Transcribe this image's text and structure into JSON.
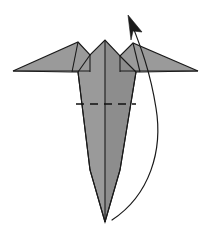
{
  "diagram": {
    "title": "Origami fold step diagram",
    "canvas": {
      "width": 211,
      "height": 243,
      "background": "#ffffff"
    },
    "colors": {
      "paper_front": "#9a9a9a",
      "paper_shade": "#8d8d8d",
      "outline": "#1a1a1a",
      "fold_line": "#111111",
      "background": "#ffffff"
    },
    "shapes": {
      "left_wing": {
        "name": "left-wing",
        "points": "13,71 78,42 90,55 90,71"
      },
      "right_wing": {
        "name": "right-wing",
        "points": "198,71 133,43 120,56 120,71"
      },
      "left_peak_panel": {
        "name": "left-peak-panel",
        "points": "78,42 90,55 90,72 72,72"
      },
      "right_peak_panel": {
        "name": "right-peak-panel",
        "points": "133,43 120,56 120,72 140,72"
      },
      "center_body": {
        "name": "center-body",
        "points": "105,40 90,55 78,72 90,170 105,222 120,170 136,72 120,56"
      },
      "body_left_half": {
        "name": "body-left-half",
        "points": "105,40 90,55 78,72 90,170 105,222"
      },
      "body_right_half": {
        "name": "body-right-half",
        "points": "105,40 120,56 136,72 120,170 105,222"
      },
      "silhouette_outline": {
        "name": "figure-outline",
        "points": "13,71 78,42 90,55 105,40 120,56 133,43 198,71 140,72 136,72 120,170 105,222 90,170 78,72 72,72"
      }
    },
    "creases": {
      "center_spine": {
        "name": "center-spine-crease",
        "path": "M 105 40 L 105 222"
      },
      "left_inner": {
        "name": "left-inner-crease",
        "path": "M 90 55 L 78 72"
      },
      "right_inner": {
        "name": "right-inner-crease",
        "path": "M 120 56 L 136 72"
      },
      "left_wing_root": {
        "name": "left-wing-root-crease",
        "path": "M 90 55 L 90 72"
      },
      "right_wing_root": {
        "name": "right-wing-root-crease",
        "path": "M 120 56 L 120 72"
      },
      "left_body_edge": {
        "name": "left-body-edge",
        "path": "M 78 72 L 90 170 L 105 222"
      },
      "right_body_edge": {
        "name": "right-body-edge",
        "path": "M 136 72 L 120 170 L 105 222"
      },
      "wing_base_left": {
        "name": "left-wing-base-edge",
        "path": "M 13 71 L 90 71"
      },
      "wing_base_right": {
        "name": "right-wing-base-edge",
        "path": "M 198 71 L 120 71"
      },
      "left_flap_fold": {
        "name": "left-flap-fold",
        "path": "M 78 42 L 72 72"
      },
      "right_flap_fold": {
        "name": "right-flap-fold",
        "path": "M 133 43 L 140 72"
      }
    },
    "fold_marks": [
      {
        "name": "valley-fold-dashed-line",
        "type": "dashed",
        "path": "M 76 104 L 136 104",
        "label": "horizontal valley fold"
      }
    ],
    "arrows": [
      {
        "name": "fold-action-arrow",
        "type": "curved",
        "direction": "up-left",
        "path": "M 112 220 C 150 195 163 150 156 108 C 150 70 140 45 131 22",
        "head_points": "128,15 142,32 133,31 131,40",
        "description": "Curved arrow sweeping from bottom right of the body upward to the top, indicating the flap is folded up and over."
      }
    ]
  }
}
